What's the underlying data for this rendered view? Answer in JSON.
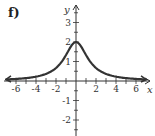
{
  "panel_label": "f)",
  "chart_data": {
    "type": "line",
    "title": "",
    "xlabel": "x",
    "ylabel": "y",
    "xlim": [
      -7,
      7
    ],
    "ylim": [
      -2.8,
      3.8
    ],
    "x_ticks": [
      -6,
      -4,
      -2,
      2,
      4,
      6
    ],
    "y_ticks": [
      -2,
      -1,
      1,
      2,
      3
    ],
    "x_tick_labels": [
      "-6",
      "-4",
      "-2",
      "2",
      "4",
      "6"
    ],
    "y_tick_labels": [
      "-2",
      "-1",
      "1",
      "2",
      "3"
    ],
    "grid": false,
    "legend": null,
    "series": [
      {
        "name": "curve",
        "color": "#333333",
        "x": [
          -7,
          -6,
          -5,
          -4,
          -3,
          -2,
          -1.5,
          -1,
          -0.5,
          0,
          0.5,
          1,
          1.5,
          2,
          3,
          4,
          5,
          6,
          7
        ],
        "y": [
          0.08,
          0.11,
          0.15,
          0.22,
          0.36,
          0.67,
          0.94,
          1.33,
          1.78,
          2.0,
          1.78,
          1.33,
          0.94,
          0.67,
          0.36,
          0.22,
          0.15,
          0.11,
          0.08
        ]
      }
    ],
    "annotations": [
      "curve has arrows on both ends (asymptotic to x-axis)"
    ]
  }
}
